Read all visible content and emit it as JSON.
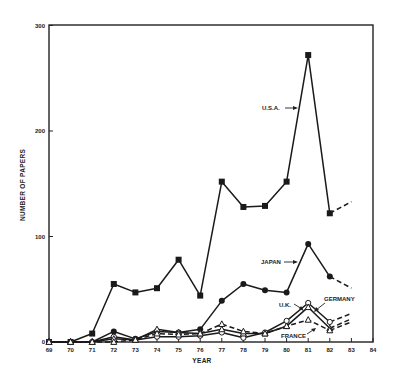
{
  "chart_data": {
    "type": "line",
    "title": "",
    "xlabel": "YEAR",
    "ylabel": "NUMBER OF PAPERS",
    "x": [
      "69",
      "70",
      "71",
      "72",
      "73",
      "74",
      "75",
      "76",
      "77",
      "78",
      "79",
      "80",
      "81",
      "82"
    ],
    "x_ticks": [
      "69",
      "70",
      "71",
      "72",
      "73",
      "74",
      "75",
      "76",
      "77",
      "78",
      "79",
      "80",
      "81",
      "82",
      "83",
      "84"
    ],
    "y_ticks": [
      "0",
      "100",
      "200",
      "300"
    ],
    "ylim": [
      0,
      300
    ],
    "xlim": [
      "69",
      "84"
    ],
    "grid": false,
    "legend": "inline labels with arrows",
    "series": [
      {
        "name": "U.S.A.",
        "marker": "filled-square",
        "style": "solid",
        "values": [
          0,
          0,
          8,
          55,
          47,
          51,
          78,
          44,
          152,
          128,
          129,
          152,
          272,
          122
        ],
        "projection": {
          "x": "83",
          "value": 133
        }
      },
      {
        "name": "JAPAN",
        "marker": "filled-circle",
        "style": "solid",
        "values": [
          0,
          0,
          0,
          10,
          3,
          10,
          9,
          12,
          39,
          55,
          49,
          47,
          93,
          62
        ],
        "projection": {
          "x": "83",
          "value": 51
        }
      },
      {
        "name": "GERMANY",
        "marker": "open-circle",
        "style": "solid",
        "values": [
          0,
          0,
          0,
          5,
          2,
          5,
          5,
          6,
          9,
          4,
          9,
          20,
          37,
          19
        ],
        "projection": {
          "x": "83",
          "value": 27
        }
      },
      {
        "name": "U.K.",
        "marker": "open-triangle",
        "style": "solid",
        "values": [
          0,
          0,
          0,
          3,
          2,
          12,
          9,
          8,
          12,
          8,
          8,
          15,
          33,
          13
        ],
        "projection": {
          "x": "83",
          "value": 22
        }
      },
      {
        "name": "FRANCE",
        "marker": "open-triangle",
        "style": "dashed",
        "values": [
          0,
          0,
          0,
          0,
          2,
          8,
          7,
          8,
          17,
          10,
          8,
          15,
          21,
          11
        ],
        "projection": {
          "x": "83",
          "value": 19
        }
      }
    ],
    "annotations": [
      {
        "text": "U.S.A.",
        "points_to": "U.S.A. line near 81"
      },
      {
        "text": "JAPAN",
        "points_to": "JAPAN line near 81"
      },
      {
        "text": "U.K.",
        "points_to": "U.K. line at 81"
      },
      {
        "text": "GERMANY",
        "points_to": "GERMANY line at 81"
      },
      {
        "text": "FRANCE",
        "points_to": "FRANCE line near 81"
      }
    ]
  },
  "labels": {
    "usa": "U.S.A.",
    "japan": "JAPAN",
    "uk": "U.K.",
    "germany": "GERMANY",
    "france": "FRANCE",
    "xlabel": "YEAR",
    "ylabel": "NUMBER OF PAPERS"
  }
}
